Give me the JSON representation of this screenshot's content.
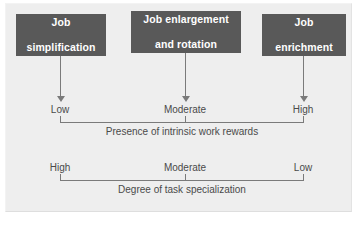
{
  "figure": {
    "panel_color": "#eeeeee",
    "box_color": "#595959",
    "line_color": "#7a7a7a",
    "text_color": "#4a4a4a"
  },
  "boxes": [
    {
      "id": "job-simplification",
      "line1": "Job",
      "line2": "simplification"
    },
    {
      "id": "job-enlargement-and-rotation",
      "line1": "Job enlargement",
      "line2": "and rotation"
    },
    {
      "id": "job-enrichment",
      "line1": "Job",
      "line2": "enrichment"
    }
  ],
  "scales": [
    {
      "id": "presence-of-intrinsic-work-rewards",
      "caption": "Presence of intrinsic work rewards",
      "points": [
        "Low",
        "Moderate",
        "High"
      ]
    },
    {
      "id": "degree-of-task-specialization",
      "caption": "Degree of task specialization",
      "points": [
        "High",
        "Moderate",
        "Low"
      ]
    }
  ],
  "arrows": {
    "count": 3,
    "direction": "down"
  }
}
